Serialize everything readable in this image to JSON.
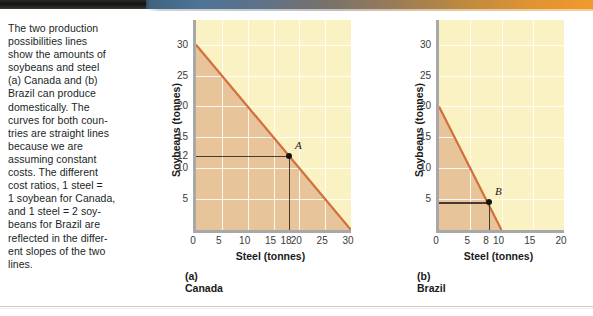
{
  "caption": {
    "text": "The two production\npossibilities lines\nshow the amounts of\nsoybeans and steel\n(a) Canada and (b)\nBrazil can produce\ndomestically. The\ncurves for both coun-\ntries are straight lines\nbecause we are\nassuming constant\ncosts. The different\ncost ratios, 1 steel =\n1 soybean for Canada,\nand 1 steel = 2 soy-\nbeans for Brazil are\nreflected in the differ-\nent slopes of the two\nlines."
  },
  "colors": {
    "feasible_fill": "#e8c49a",
    "outside_fill": "#fbf2c4",
    "ppf_line": "#d2703c",
    "axis": "#a8a8a8",
    "grid": "#ffffff",
    "point": "#141414",
    "guide": "#4a3b31"
  },
  "chart_data": [
    {
      "type": "line",
      "title": "(a) Canada",
      "xlabel": "Steel (tonnes)",
      "ylabel": "Soybeans (tonnes)",
      "xlim": [
        0,
        30
      ],
      "ylim": [
        0,
        34
      ],
      "grid": true,
      "xticks": [
        0,
        5,
        10,
        15,
        18,
        20,
        25,
        30
      ],
      "yticks": [
        5,
        10,
        12,
        15,
        20,
        25,
        30
      ],
      "series": [
        {
          "name": "Canada production possibilities line",
          "x": [
            0,
            30
          ],
          "values": [
            30,
            0
          ]
        }
      ],
      "annotations": [
        {
          "label": "A",
          "x": 18,
          "y": 12
        }
      ],
      "cost_ratio": "1 steel = 1 soybean"
    },
    {
      "type": "line",
      "title": "(b) Brazil",
      "xlabel": "Steel (tonnes)",
      "ylabel": "Soybeans (tonnes)",
      "xlim": [
        0,
        20
      ],
      "ylim": [
        0,
        34
      ],
      "grid": true,
      "xticks": [
        0,
        5,
        8,
        10,
        15,
        20
      ],
      "yticks": [
        5,
        10,
        15,
        20,
        25,
        30
      ],
      "series": [
        {
          "name": "Brazil production possibilities line",
          "x": [
            0,
            10
          ],
          "values": [
            20,
            0
          ]
        }
      ],
      "annotations": [
        {
          "label": "B",
          "x": 8,
          "y": 4.5
        }
      ],
      "cost_ratio": "1 steel = 2 soybeans"
    }
  ]
}
